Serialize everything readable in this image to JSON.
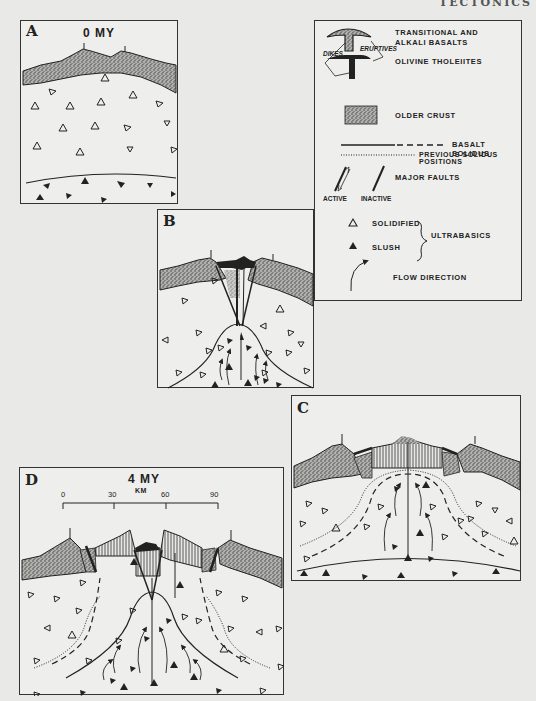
{
  "page": {
    "header": "TECTONICS"
  },
  "panels": {
    "A": {
      "letter": "A",
      "time": "0 MY"
    },
    "B": {
      "letter": "B"
    },
    "C": {
      "letter": "C"
    },
    "D": {
      "letter": "D",
      "time": "4 MY",
      "scale": {
        "unit": "KM",
        "ticks": [
          "0",
          "30",
          "60",
          "90"
        ]
      }
    }
  },
  "legend": {
    "items": [
      {
        "symbol": "basalt-t-dotted",
        "label": "TRANSITIONAL AND ALKALI BASALTS"
      },
      {
        "symbol": "basalt-t-solid",
        "label": "OLIVINE THOLEIITES"
      },
      {
        "symbol": "stipple-box",
        "label": "OLDER CRUST"
      },
      {
        "symbol": "solid-dash-line",
        "label": "BASALT SOLIDUS"
      },
      {
        "symbol": "dotted-line",
        "label": "PREVIOUS SOLIDUS POSITIONS"
      },
      {
        "symbol": "fault-lines",
        "label": "MAJOR FAULTS"
      },
      {
        "symbol": "open-triangle",
        "label": "SOLIDIFIED"
      },
      {
        "symbol": "filled-triangle",
        "label": "SLUSH"
      },
      {
        "symbol": "curved-arrow",
        "label": "FLOW DIRECTION"
      }
    ],
    "annotations": {
      "dikes": "DIKES",
      "eruptives": "ERUPTIVES",
      "active": "ACTIVE",
      "inactive": "INACTIVE",
      "group_label": "ULTRABASICS"
    }
  },
  "colors": {
    "background": "#e9e9e7",
    "panel": "#eeeeec",
    "ink": "#222222",
    "crust_fill": "#8a8a88"
  }
}
